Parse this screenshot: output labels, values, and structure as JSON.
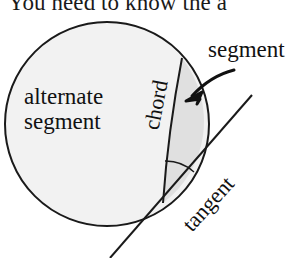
{
  "page": {
    "background_color": "#ffffff",
    "width": 304,
    "height": 258
  },
  "heading": {
    "text": "You need to know the a",
    "clipped": true
  },
  "figure": {
    "name": "alternate-segment-theorem-diagram",
    "colors": {
      "stroke": "#1a1a1a",
      "circle_fill": "#f2f2f2",
      "segment_fill": "#e0e0e0",
      "text": "#111111"
    },
    "circle": {
      "cx": 107,
      "cy": 124,
      "r": 102
    },
    "chord": {
      "x1": 182,
      "y1": 58,
      "x2": 163,
      "y2": 203
    },
    "tangent": {
      "x1": 110,
      "y1": 258,
      "x2": 252,
      "y2": 95,
      "point_of_contact_x": 163,
      "point_of_contact_y": 203
    },
    "angle_arc": {
      "cx": 163,
      "cy": 203,
      "r": 42
    },
    "pointer_arrow": {
      "from_x": 232,
      "from_y": 72,
      "to_x": 190,
      "to_y": 99
    }
  },
  "labels": {
    "alternate_segment_line1": "alternate",
    "alternate_segment_line2": "segment",
    "segment": "segment",
    "chord": "chord",
    "tangent": "tangent"
  }
}
